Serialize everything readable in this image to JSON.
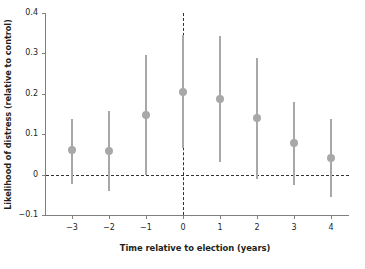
{
  "chart_data": {
    "type": "scatter",
    "title": "",
    "xlabel": "Time relative to election (years)",
    "ylabel": "Likelihood of distress (relative to control)",
    "x": [
      -3,
      -2,
      -1,
      0,
      1,
      2,
      3,
      4
    ],
    "xtick_labels": [
      "−3",
      "−2",
      "−1",
      "0",
      "1",
      "2",
      "3",
      "4"
    ],
    "ytick_labels": [
      "0.4",
      "0.3",
      "0.2",
      "0.1",
      "0",
      "−0.1"
    ],
    "ytick_values": [
      0.4,
      0.3,
      0.2,
      0.1,
      0,
      -0.1
    ],
    "xlim": [
      -3.6,
      4.6
    ],
    "ylim": [
      -0.1,
      0.4
    ],
    "grid": false,
    "legend": null,
    "series": [
      {
        "name": "Likelihood of distress (relative to control)",
        "marker": "filled-circle",
        "color": "#a8a8a8",
        "values": [
          0.06,
          0.059,
          0.148,
          0.205,
          0.186,
          0.139,
          0.077,
          0.042
        ],
        "ci_low": [
          -0.023,
          -0.04,
          0.0,
          0.065,
          0.031,
          -0.012,
          -0.026,
          -0.055
        ],
        "ci_high": [
          0.137,
          0.157,
          0.297,
          0.345,
          0.342,
          0.288,
          0.18,
          0.138
        ]
      }
    ],
    "reference_lines": [
      {
        "orientation": "horizontal",
        "value": 0,
        "style": "dashed",
        "color": "#333333"
      },
      {
        "orientation": "vertical",
        "value": 0,
        "style": "dashed",
        "color": "#333333"
      }
    ]
  }
}
